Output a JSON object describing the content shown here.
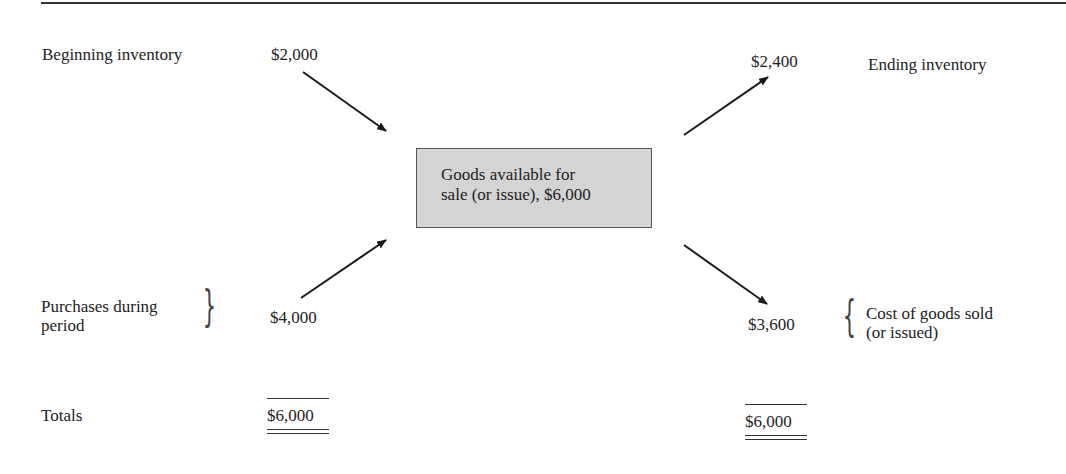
{
  "diagram": {
    "center_box": {
      "line1": "Goods available for",
      "line2": "sale (or issue), $6,000",
      "fill": "#d4d4d4"
    },
    "left": {
      "beginning_inventory": {
        "label": "Beginning inventory",
        "value": "$2,000"
      },
      "purchases": {
        "label_line1": "Purchases during",
        "label_line2": "period",
        "value": "$4,000"
      },
      "totals": {
        "label": "Totals",
        "value": "$6,000"
      }
    },
    "right": {
      "ending_inventory": {
        "label": "Ending inventory",
        "value": "$2,400"
      },
      "cost_of_goods_sold": {
        "label_line1": "Cost of goods sold",
        "label_line2": "(or issued)",
        "value": "$3,600"
      },
      "totals": {
        "value": "$6,000"
      }
    },
    "arrows": [
      {
        "from": "beginning-inventory",
        "to": "goods-available"
      },
      {
        "from": "purchases",
        "to": "goods-available"
      },
      {
        "from": "goods-available",
        "to": "ending-inventory"
      },
      {
        "from": "goods-available",
        "to": "cost-of-goods-sold"
      }
    ],
    "braces": {
      "left": "}",
      "right": "{"
    }
  }
}
